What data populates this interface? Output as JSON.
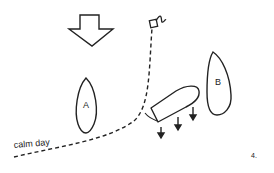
{
  "figure": {
    "number": "4.",
    "path_label": "calm day",
    "boats": [
      {
        "id": "A",
        "label": "A"
      },
      {
        "id": "B",
        "label": "B"
      },
      {
        "id": "C",
        "label": ""
      }
    ],
    "icons": {
      "wind": "wind-direction-arrow-icon",
      "mark": "buoy-mark-icon",
      "drift": "drift-arrow-icon"
    },
    "colors": {
      "stroke": "#222222",
      "background": "#ffffff"
    }
  }
}
